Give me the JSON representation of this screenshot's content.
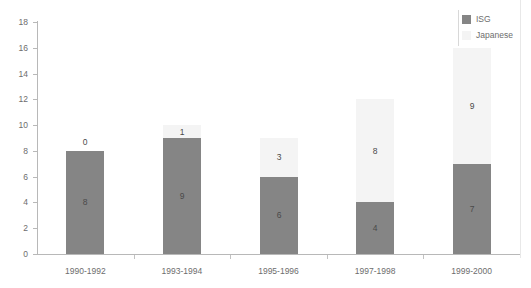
{
  "chart_data": {
    "type": "bar",
    "subtype": "stacked-bar",
    "title": "",
    "subtitle": "",
    "xlabel": "",
    "ylabel": "",
    "categories": [
      "1990-1992",
      "1993-1994",
      "1995-1996",
      "1997-1998",
      "1999-2000"
    ],
    "series": [
      {
        "name": "ISG",
        "color": "#858585",
        "values": [
          8,
          9,
          6,
          4,
          7
        ]
      },
      {
        "name": "Japanese",
        "color": "#f4f4f4",
        "values": [
          0,
          1,
          3,
          8,
          9
        ]
      }
    ],
    "totals": [
      8,
      10,
      9,
      12,
      16
    ],
    "data_labels": [
      {
        "category": "1990-1992",
        "isg": "8",
        "japanese": "0",
        "japanese_label_position": "above-bar"
      },
      {
        "category": "1993-1994",
        "isg": "9",
        "japanese": "1",
        "japanese_label_position": "inside"
      },
      {
        "category": "1995-1996",
        "isg": "6",
        "japanese": "3",
        "japanese_label_position": "inside"
      },
      {
        "category": "1997-1998",
        "isg": "4",
        "japanese": "8",
        "japanese_label_position": "inside"
      },
      {
        "category": "1999-2000",
        "isg": "7",
        "japanese": "9",
        "japanese_label_position": "inside"
      }
    ],
    "ylim": [
      0,
      18
    ],
    "ytick_values": [
      "0",
      "2",
      "4",
      "6",
      "8",
      "10",
      "12",
      "14",
      "16",
      "18"
    ],
    "ytick_step": 2,
    "grid": false,
    "legend": {
      "position": "top-right",
      "entries": [
        {
          "label": "ISG",
          "color": "#858585"
        },
        {
          "label": "Japanese",
          "color": "#f4f4f4"
        }
      ]
    }
  }
}
